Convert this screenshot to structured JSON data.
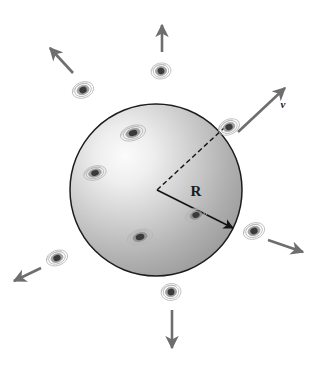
{
  "figure": {
    "background_color": "#ffffff"
  },
  "sphere": {
    "name": "shaded-sphere",
    "center_x": 156,
    "center_y": 190,
    "radius": 86,
    "outline_color": "#1c1c1c",
    "fill_light": "#f2f2f2",
    "fill_mid": "#b3b3b3",
    "fill_dark": "#7d7d7d",
    "highlight_x": 108,
    "highlight_y": 150
  },
  "labels": {
    "radius_label": "R",
    "radius_label_x": 196,
    "radius_label_y": 196,
    "radius_label_size": 15,
    "velocity_label": "v",
    "velocity_label_x": 283,
    "velocity_label_y": 108,
    "velocity_label_size": 11
  },
  "radius_arrow": {
    "name": "radius-arrow",
    "x1": 157,
    "y1": 190,
    "x2": 233,
    "y2": 228,
    "color": "#141414",
    "width": 1.6
  },
  "dashed_line": {
    "name": "dashed-radius-line",
    "x1": 157,
    "y1": 190,
    "x2": 224,
    "y2": 128,
    "color": "#141414",
    "width": 1.4,
    "dash": "5,3"
  },
  "galaxies": [
    {
      "name": "galaxy-inside-upper",
      "cx": 133,
      "cy": 133,
      "rx": 13,
      "ry": 7.5,
      "rot": -18,
      "inside": true
    },
    {
      "name": "galaxy-inside-left",
      "cx": 95,
      "cy": 173,
      "rx": 11.5,
      "ry": 7,
      "rot": -15,
      "inside": true
    },
    {
      "name": "galaxy-inside-lower-left",
      "cx": 140,
      "cy": 237,
      "rx": 13,
      "ry": 7.5,
      "rot": -16,
      "inside": true
    },
    {
      "name": "galaxy-inside-lower-right",
      "cx": 196,
      "cy": 215,
      "rx": 11,
      "ry": 7,
      "rot": -20,
      "inside": true
    },
    {
      "name": "galaxy-edge-upper-right",
      "cx": 229,
      "cy": 127,
      "rx": 11,
      "ry": 7.5,
      "rot": -25,
      "inside": true
    },
    {
      "name": "galaxy-outside-top",
      "cx": 161,
      "cy": 71,
      "rx": 10,
      "ry": 8,
      "rot": -10,
      "inside": false
    },
    {
      "name": "galaxy-outside-upper-left",
      "cx": 83,
      "cy": 90,
      "rx": 11,
      "ry": 8,
      "rot": -20,
      "inside": false
    },
    {
      "name": "galaxy-outside-lower-left",
      "cx": 57,
      "cy": 258,
      "rx": 11,
      "ry": 7.5,
      "rot": -20,
      "inside": false
    },
    {
      "name": "galaxy-outside-right",
      "cx": 254,
      "cy": 231,
      "rx": 11,
      "ry": 8,
      "rot": -20,
      "inside": false
    },
    {
      "name": "galaxy-outside-bottom",
      "cx": 171,
      "cy": 292,
      "rx": 10,
      "ry": 8.5,
      "rot": -8,
      "inside": false
    }
  ],
  "velocity_arrows": [
    {
      "name": "velocity-arrow-up",
      "x1": 162,
      "y1": 52,
      "x2": 162,
      "y2": 25,
      "color": "#6e6e6e"
    },
    {
      "name": "velocity-arrow-upper-left",
      "x1": 73,
      "y1": 73,
      "x2": 50,
      "y2": 48,
      "color": "#6e6e6e"
    },
    {
      "name": "velocity-arrow-upper-right",
      "x1": 238,
      "y1": 132,
      "x2": 285,
      "y2": 88,
      "color": "#6e6e6e"
    },
    {
      "name": "velocity-arrow-lower-right",
      "x1": 268,
      "y1": 240,
      "x2": 303,
      "y2": 252,
      "color": "#6e6e6e"
    },
    {
      "name": "velocity-arrow-lower-left",
      "x1": 41,
      "y1": 268,
      "x2": 14,
      "y2": 281,
      "color": "#6e6e6e"
    },
    {
      "name": "velocity-arrow-down",
      "x1": 172,
      "y1": 310,
      "x2": 172,
      "y2": 348,
      "color": "#6e6e6e"
    }
  ],
  "galaxy_colors": {
    "core": "#3a3a3a",
    "disk": "#8a8a8a",
    "halo": "#b5b5b5"
  }
}
